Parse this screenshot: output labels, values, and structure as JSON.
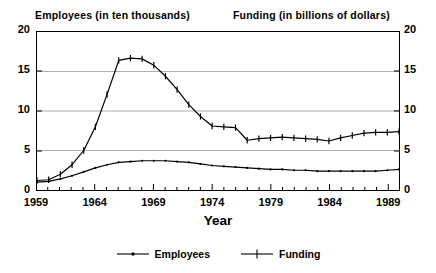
{
  "chart_data": {
    "type": "line",
    "title": "",
    "xlabel": "Year",
    "ylabel_left": "Employees (in ten thousands)",
    "ylabel_right": "Funding (in billions of dollars)",
    "ylim": [
      0,
      20
    ],
    "xlim": [
      1959,
      1990
    ],
    "yticks": [
      0,
      5,
      10,
      15,
      20
    ],
    "ytick_labels_left": [
      "0",
      "5",
      "10",
      "15",
      "20"
    ],
    "ytick_labels_right": [
      "0",
      "5",
      "10",
      "15",
      "20"
    ],
    "xticks": [
      1959,
      1964,
      1969,
      1974,
      1979,
      1984,
      1989
    ],
    "xtick_labels": [
      "1959",
      "1964",
      "1969",
      "1974",
      "1979",
      "1984",
      "1989"
    ],
    "x_minor_tick_interval": 1,
    "grid": "horizontal",
    "legend_position": "bottom-center",
    "x": [
      1959,
      1960,
      1961,
      1962,
      1963,
      1964,
      1965,
      1966,
      1967,
      1968,
      1969,
      1970,
      1971,
      1972,
      1973,
      1974,
      1975,
      1976,
      1977,
      1978,
      1979,
      1980,
      1981,
      1982,
      1983,
      1984,
      1985,
      1986,
      1987,
      1988,
      1989,
      1990
    ],
    "series": [
      {
        "name": "Employees",
        "marker": "dot",
        "axis": "left",
        "values": [
          1.0,
          1.1,
          1.4,
          1.8,
          2.3,
          2.8,
          3.2,
          3.5,
          3.6,
          3.7,
          3.7,
          3.7,
          3.6,
          3.5,
          3.3,
          3.1,
          3.0,
          2.9,
          2.8,
          2.7,
          2.6,
          2.6,
          2.5,
          2.5,
          2.4,
          2.4,
          2.4,
          2.4,
          2.4,
          2.4,
          2.5,
          2.6
        ]
      },
      {
        "name": "Funding",
        "marker": "plus",
        "axis": "right",
        "values": [
          1.2,
          1.3,
          2.0,
          3.2,
          5.0,
          8.0,
          12.1,
          16.4,
          16.7,
          16.6,
          15.8,
          14.4,
          12.7,
          10.8,
          9.3,
          8.1,
          8.0,
          7.9,
          6.3,
          6.5,
          6.6,
          6.7,
          6.6,
          6.5,
          6.4,
          6.2,
          6.6,
          6.9,
          7.2,
          7.3,
          7.3,
          7.4
        ]
      }
    ],
    "legend": [
      {
        "label": "Employees",
        "marker": "dot"
      },
      {
        "label": "Funding",
        "marker": "plus"
      }
    ]
  },
  "axis": {
    "left_ticks": [
      "20",
      "15",
      "10",
      "5",
      "0"
    ],
    "right_ticks": [
      "20",
      "15",
      "10",
      "5",
      "0"
    ],
    "x_ticks": [
      "1959",
      "1964",
      "1969",
      "1974",
      "1979",
      "1984",
      "1989"
    ],
    "x_title": "Year"
  },
  "headers": {
    "left": "Employees (in ten thousands)",
    "right": "Funding (in billions of dollars)"
  }
}
